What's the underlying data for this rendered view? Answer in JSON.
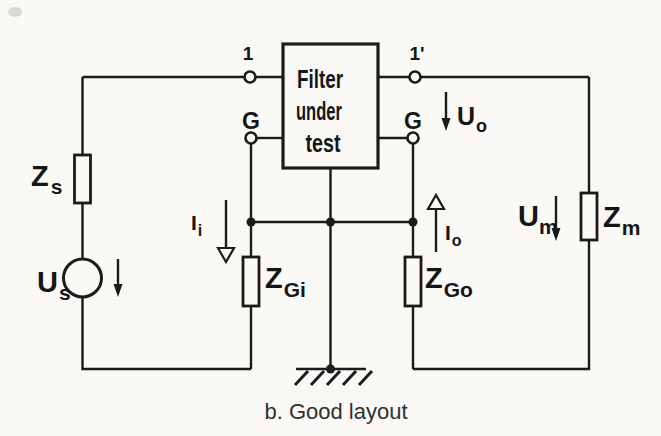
{
  "figure": {
    "caption": "b. Good layout"
  },
  "filter_box": {
    "line1": "Filter",
    "line2": "under",
    "line3": "test"
  },
  "terminals": {
    "input": "1",
    "output": "1'",
    "ground_left": "G",
    "ground_right": "G"
  },
  "labels": {
    "z_source": {
      "main": "Z",
      "sub": "s"
    },
    "u_source": {
      "main": "U",
      "sub": "s"
    },
    "i_input": {
      "main": "I",
      "sub": "i"
    },
    "z_gen_input": {
      "main": "Z",
      "sub": "Gi"
    },
    "z_gen_output": {
      "main": "Z",
      "sub": "Go"
    },
    "i_output": {
      "main": "I",
      "sub": "o"
    },
    "u_output": {
      "main": "U",
      "sub": "o"
    },
    "u_measured": {
      "main": "U",
      "sub": "m"
    },
    "z_measured": {
      "main": "Z",
      "sub": "m"
    }
  },
  "colors": {
    "ink": "#1b1b1b",
    "paper": "#faf9f6"
  }
}
